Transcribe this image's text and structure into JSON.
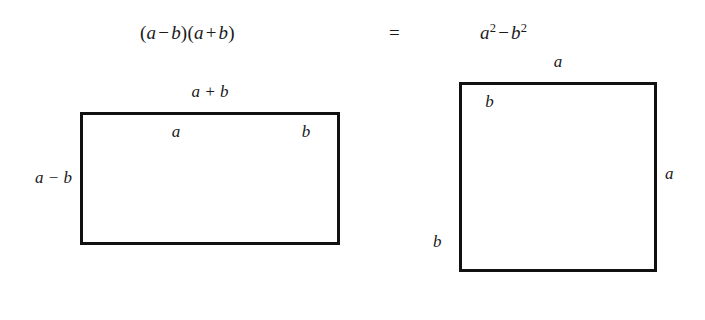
{
  "equation": {
    "lhs": {
      "open_paren": "(",
      "a1": "a",
      "minus": "−",
      "b1": "b",
      "close_paren": ")",
      "open_paren2": "(",
      "a2": "a",
      "plus": "+",
      "b2": "b",
      "close_paren2": ")",
      "plain": "(a − b)(a + b)"
    },
    "equals": "=",
    "rhs": {
      "a": "a",
      "a_exponent": "2",
      "minus": "−",
      "b": "b",
      "b_exponent": "2",
      "plain": "a² − b²"
    }
  },
  "left_figure": {
    "name": "rectangle-a-minus-b-by-a-plus-b",
    "top_label": "a + b",
    "side_label": "a − b",
    "bottom_label_light": "a",
    "bottom_label_dark": "b",
    "regions": [
      {
        "name": "light-region-width-a",
        "fill": "#d2d2d2",
        "width_label": "a"
      },
      {
        "name": "dark-region-width-b",
        "fill": "#4a4a4a",
        "width_label": "b"
      }
    ]
  },
  "right_figure": {
    "name": "square-side-a",
    "top_label": "a",
    "side_label": "a",
    "inner_left_label": "b",
    "bottom_label": "b",
    "regions": [
      {
        "name": "light-region-top",
        "fill": "#d2d2d2"
      },
      {
        "name": "white-square-b-by-b",
        "fill": "#ffffff"
      },
      {
        "name": "dark-region-bottom-right",
        "fill": "#4a4a4a"
      }
    ]
  },
  "colors": {
    "light_fill": "#d2d2d2",
    "dark_fill": "#4a4a4a",
    "white_fill": "#ffffff",
    "stroke": "#111111",
    "background": "#ffffff",
    "text": "#1a1a1a"
  }
}
